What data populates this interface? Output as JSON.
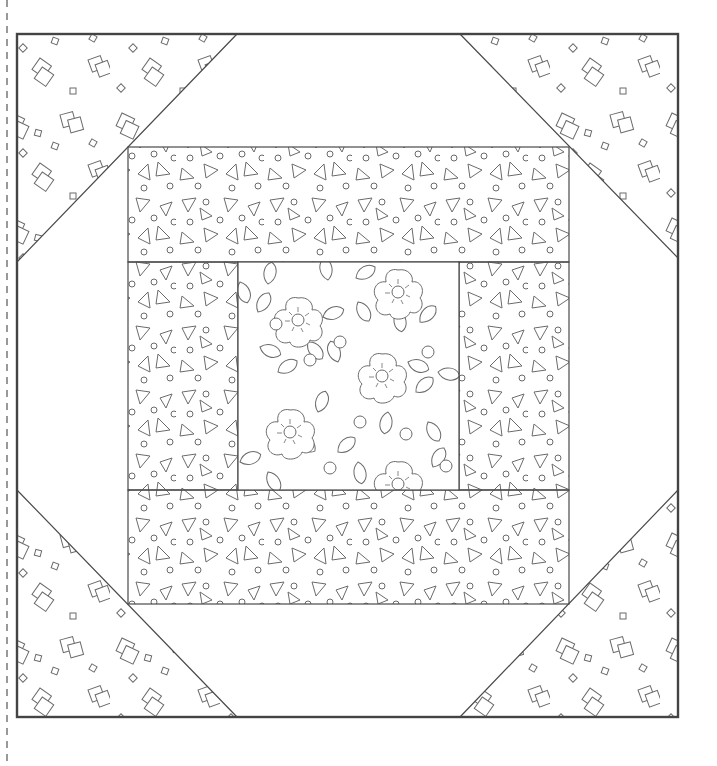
{
  "figure": {
    "type": "quilt-block-pattern",
    "colors": {
      "line": "#4a4a4a",
      "outer_border": "#444444",
      "motif": "#6a6a6a",
      "background": "#ffffff"
    },
    "cut_line": {
      "style": "dashed",
      "x": 7
    },
    "outer_square": {
      "x": 17,
      "y": 34,
      "w": 661,
      "h": 683
    },
    "inner_frame": {
      "x": 128,
      "y": 147,
      "w": 441,
      "h": 457
    },
    "center_square": {
      "x": 238,
      "y": 262,
      "w": 221,
      "h": 228
    },
    "pieces": [
      {
        "name": "corner-triangle-top-left",
        "fabric": "squares-print"
      },
      {
        "name": "corner-triangle-top-right",
        "fabric": "squares-print"
      },
      {
        "name": "corner-triangle-bottom-left",
        "fabric": "squares-print"
      },
      {
        "name": "corner-triangle-bottom-right",
        "fabric": "squares-print"
      },
      {
        "name": "top-strip",
        "fabric": "triangles-dots-print"
      },
      {
        "name": "bottom-strip",
        "fabric": "triangles-dots-print"
      },
      {
        "name": "left-strip",
        "fabric": "triangles-dots-print"
      },
      {
        "name": "right-strip",
        "fabric": "triangles-dots-print"
      },
      {
        "name": "center-square",
        "fabric": "floral-print"
      }
    ]
  }
}
